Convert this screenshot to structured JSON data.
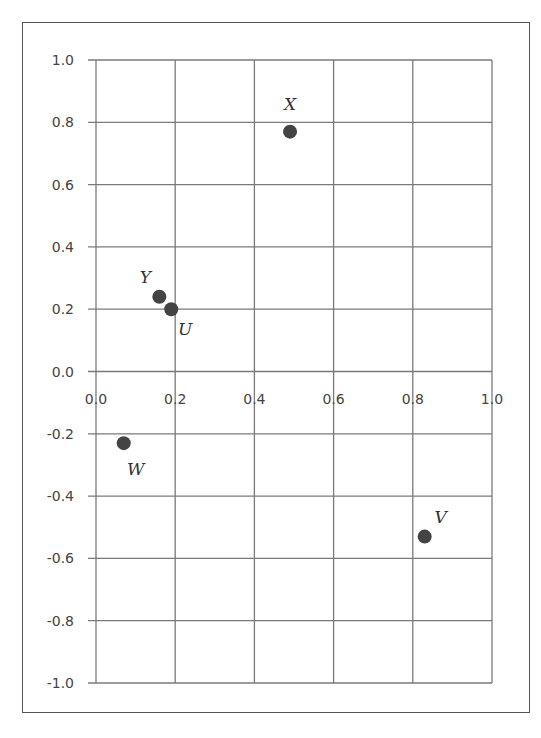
{
  "chart_data": {
    "type": "scatter",
    "title": "",
    "xlabel": "",
    "ylabel": "",
    "xlim": [
      0.0,
      1.0
    ],
    "ylim": [
      -1.0,
      1.0
    ],
    "grid": true,
    "legend": null,
    "x_ticks": [
      "0.0",
      "0.2",
      "0.4",
      "0.6",
      "0.8",
      "1.0"
    ],
    "y_ticks": [
      "1.0",
      "0.8",
      "0.6",
      "0.4",
      "0.2",
      "0.0",
      "-0.2",
      "-0.4",
      "-0.6",
      "-0.8",
      "-1.0"
    ],
    "points": [
      {
        "label": "X",
        "x": 0.49,
        "y": 0.77
      },
      {
        "label": "Y",
        "x": 0.16,
        "y": 0.24
      },
      {
        "label": "U",
        "x": 0.19,
        "y": 0.2
      },
      {
        "label": "W",
        "x": 0.07,
        "y": -0.23
      },
      {
        "label": "V",
        "x": 0.83,
        "y": -0.53
      }
    ],
    "colors": {
      "point": "#444444",
      "grid": "#7a7a7a",
      "frame": "#555555",
      "text": "#444444"
    }
  }
}
